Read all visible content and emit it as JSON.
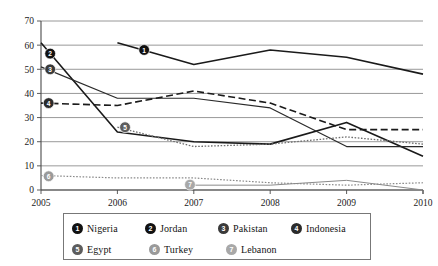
{
  "chart_data": {
    "type": "line",
    "title": "",
    "subtitle": "",
    "xlabel": "",
    "ylabel": "",
    "x": [
      "2005",
      "2006",
      "2007",
      "2008",
      "2009",
      "2010"
    ],
    "xlim": [
      "2005",
      "2010"
    ],
    "ylim": [
      0,
      70
    ],
    "yticks": [
      0,
      10,
      20,
      30,
      40,
      50,
      60,
      70
    ],
    "xticks": [
      "2005",
      "2006",
      "2007",
      "2008",
      "2009",
      "2010"
    ],
    "grid": "horizontal",
    "legend_position": "bottom",
    "series": [
      {
        "key": "nigeria",
        "number": "1",
        "name": "Nigeria",
        "color": "#1a1a1a",
        "marker_color": "#111111",
        "style": "solid",
        "width": 1.6,
        "x": [
          "2006",
          "2007",
          "2008",
          "2009",
          "2010"
        ],
        "values": [
          61,
          52,
          58,
          55,
          48
        ],
        "marker_at": "2006.35",
        "marker_value": 58
      },
      {
        "key": "jordan",
        "number": "2",
        "name": "Jordan",
        "color": "#1a1a1a",
        "marker_color": "#111111",
        "style": "solid",
        "width": 1.6,
        "x": [
          "2005",
          "2006",
          "2007",
          "2008",
          "2009",
          "2010"
        ],
        "values": [
          61,
          24,
          20,
          19,
          28,
          14
        ],
        "marker_at": "2005.12",
        "marker_value": 56.5
      },
      {
        "key": "pakistan",
        "number": "3",
        "name": "Pakistan",
        "color": "#2a2a2a",
        "marker_color": "#3a3a3a",
        "style": "solid",
        "width": 1.2,
        "x": [
          "2005",
          "2006",
          "2007",
          "2008",
          "2009",
          "2010"
        ],
        "values": [
          51,
          38,
          38,
          34,
          18,
          18
        ],
        "marker_at": "2005.12",
        "marker_value": 50
      },
      {
        "key": "indonesia",
        "number": "4",
        "name": "Indonesia",
        "color": "#1a1a1a",
        "marker_color": "#2b2b2b",
        "style": "dashed",
        "width": 1.6,
        "x": [
          "2005",
          "2006",
          "2007",
          "2008",
          "2009",
          "2010"
        ],
        "values": [
          36,
          35,
          41,
          36,
          25,
          25
        ],
        "marker_at": "2005.1",
        "marker_value": 36
      },
      {
        "key": "egypt",
        "number": "5",
        "name": "Egypt",
        "color": "#6e6e6e",
        "marker_color": "#5d5d5d",
        "style": "dotted",
        "width": 1.3,
        "x": [
          "2006",
          "2007",
          "2008",
          "2009",
          "2010"
        ],
        "values": [
          26,
          18,
          19,
          22,
          19
        ],
        "marker_at": "2006.1",
        "marker_value": 26
      },
      {
        "key": "turkey",
        "number": "6",
        "name": "Turkey",
        "color": "#8a8a8a",
        "marker_color": "#9a9a9a",
        "style": "dotted",
        "width": 1.2,
        "x": [
          "2005",
          "2006",
          "2007",
          "2008",
          "2009",
          "2010"
        ],
        "values": [
          6,
          5,
          5,
          3,
          2,
          3
        ],
        "marker_at": "2005.1",
        "marker_value": 5.7
      },
      {
        "key": "lebanon",
        "number": "7",
        "name": "Lebanon",
        "color": "#8a8a8a",
        "marker_color": "#a8a8a8",
        "style": "solid",
        "width": 1.0,
        "x": [
          "2007",
          "2008",
          "2009",
          "2010"
        ],
        "values": [
          2,
          2,
          4,
          0
        ],
        "marker_at": "2006.95",
        "marker_value": 2.2
      }
    ]
  },
  "legend": {
    "rows": [
      [
        {
          "number": "1",
          "name": "Nigeria",
          "color": "#111111"
        },
        {
          "number": "2",
          "name": "Jordan",
          "color": "#111111"
        },
        {
          "number": "3",
          "name": "Pakistan",
          "color": "#3a3a3a"
        },
        {
          "number": "4",
          "name": "Indonesia",
          "color": "#2b2b2b"
        }
      ],
      [
        {
          "number": "5",
          "name": "Egypt",
          "color": "#5d5d5d"
        },
        {
          "number": "6",
          "name": "Turkey",
          "color": "#9a9a9a"
        },
        {
          "number": "7",
          "name": "Lebanon",
          "color": "#a8a8a8"
        }
      ]
    ]
  },
  "axes": {
    "y_labels": [
      "70",
      "60",
      "50",
      "40",
      "30",
      "20",
      "10",
      "0"
    ],
    "x_labels": [
      "2005",
      "2006",
      "2007",
      "2008",
      "2009",
      "2010"
    ]
  }
}
